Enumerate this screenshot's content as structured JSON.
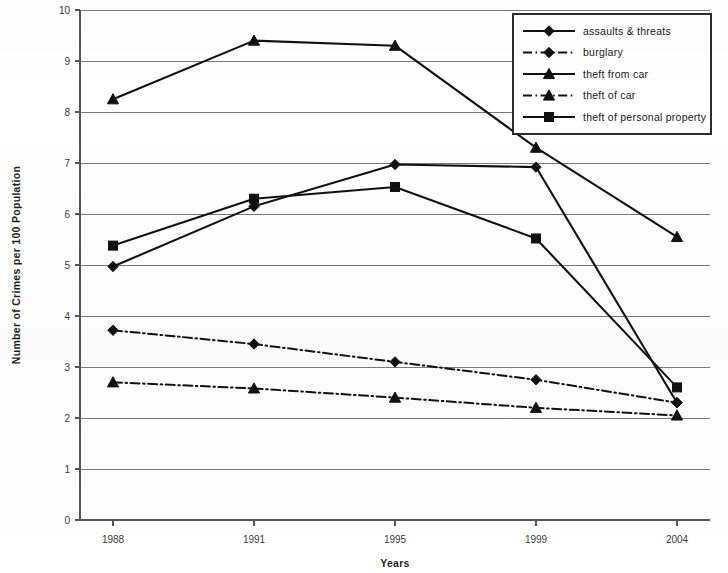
{
  "chart_data": {
    "type": "line",
    "title": "",
    "xlabel": "Years",
    "ylabel": "Number of Crimes per 100 Population",
    "categories": [
      "1988",
      "1991",
      "1995",
      "1999",
      "2004"
    ],
    "x_tick_labels": [
      "1988",
      "1991",
      "1995",
      "1999",
      "2004"
    ],
    "y_tick_labels": [
      "0",
      "1",
      "2",
      "3",
      "4",
      "5",
      "6",
      "7",
      "8",
      "9",
      "10"
    ],
    "ylim": [
      0,
      10
    ],
    "y_tick_step": 1,
    "grid": true,
    "grid_axis": "y",
    "legend_position": "top-right",
    "series": [
      {
        "name": "assaults & threats",
        "marker": "diamond",
        "line_style": "solid",
        "color": "#111111",
        "values": [
          4.97,
          6.15,
          6.97,
          6.92,
          2.3
        ]
      },
      {
        "name": "burglary",
        "marker": "diamond",
        "line_style": "dash-dot",
        "color": "#111111",
        "values": [
          3.72,
          3.45,
          3.1,
          2.75,
          2.3
        ]
      },
      {
        "name": "theft from car",
        "marker": "triangle",
        "line_style": "solid",
        "color": "#111111",
        "values": [
          8.25,
          9.4,
          9.3,
          7.3,
          5.55
        ]
      },
      {
        "name": "theft of car",
        "marker": "triangle",
        "line_style": "dash-dot",
        "color": "#111111",
        "values": [
          2.7,
          2.58,
          2.4,
          2.2,
          2.05
        ]
      },
      {
        "name": "theft of personal property",
        "marker": "square",
        "line_style": "solid",
        "color": "#111111",
        "values": [
          5.38,
          6.3,
          6.53,
          5.52,
          2.6
        ]
      }
    ]
  },
  "legend": {
    "entries": [
      {
        "label": "assaults & threats"
      },
      {
        "label": "burglary"
      },
      {
        "label": "theft from car"
      },
      {
        "label": "theft of car"
      },
      {
        "label": "theft of personal property"
      }
    ]
  },
  "axes": {
    "y_title": "Number of Crimes per 100 Population",
    "x_title": "Years"
  }
}
